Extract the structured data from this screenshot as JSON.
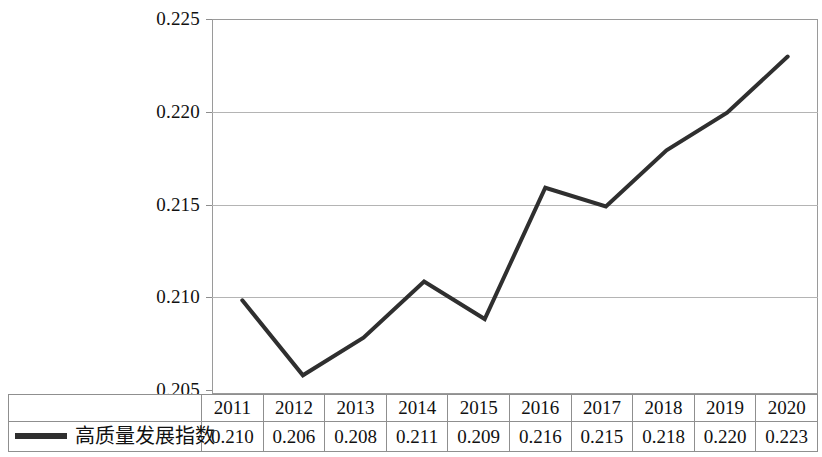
{
  "chart_data": {
    "type": "line",
    "title": "",
    "xlabel": "",
    "ylabel": "",
    "categories": [
      "2011",
      "2012",
      "2013",
      "2014",
      "2015",
      "2016",
      "2017",
      "2018",
      "2019",
      "2020"
    ],
    "series": [
      {
        "name": "高质量发展指数",
        "values": [
          0.21,
          0.206,
          0.208,
          0.211,
          0.209,
          0.216,
          0.215,
          0.218,
          0.22,
          0.223
        ],
        "value_labels": [
          "0.210",
          "0.206",
          "0.208",
          "0.211",
          "0.209",
          "0.216",
          "0.215",
          "0.218",
          "0.220",
          "0.223"
        ],
        "color": "#2f2f2f",
        "line_width": 4,
        "markers": false
      }
    ],
    "ylim": [
      0.205,
      0.225
    ],
    "ytick_values": [
      0.225,
      0.22,
      0.215,
      0.21,
      0.205
    ],
    "ytick_labels": [
      "0.225",
      "0.220",
      "0.215",
      "0.210",
      "0.205"
    ],
    "grid": true,
    "grid_axis": "y",
    "legend_position": "table-left",
    "has_data_table": true
  },
  "axis": {
    "y_labels": [
      "0.225",
      "0.220",
      "0.215",
      "0.210",
      "0.205"
    ]
  },
  "table": {
    "legend_label": "高质量发展指数",
    "years": [
      "2011",
      "2012",
      "2013",
      "2014",
      "2015",
      "2016",
      "2017",
      "2018",
      "2019",
      "2020"
    ],
    "values": [
      "0.210",
      "0.206",
      "0.208",
      "0.211",
      "0.209",
      "0.216",
      "0.215",
      "0.218",
      "0.220",
      "0.223"
    ]
  },
  "colors": {
    "series_line": "#2f2f2f",
    "grid": "#b4b4b4",
    "frame": "#9a9a9a",
    "table_border": "#8f8f8f",
    "text": "#111111",
    "background": "#ffffff"
  }
}
